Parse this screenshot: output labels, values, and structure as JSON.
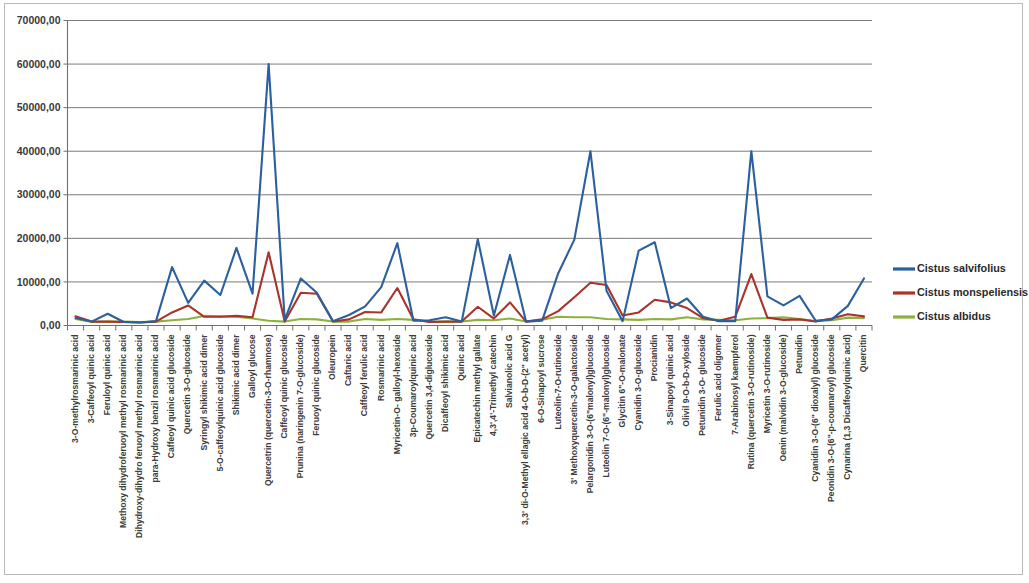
{
  "chart_data": {
    "type": "line",
    "title": "",
    "subtitle": "",
    "xlabel": "",
    "ylabel": "",
    "ylim": [
      0,
      70000
    ],
    "ytick_labels": [
      "0,00",
      "10000,00",
      "20000,00",
      "30000,00",
      "40000,00",
      "50000,00",
      "60000,00",
      "70000,00"
    ],
    "ytick_values": [
      0,
      10000,
      20000,
      30000,
      40000,
      50000,
      60000,
      70000
    ],
    "grid": true,
    "legend_position": "right",
    "categories": [
      "3-O-methylrosmarinic acid",
      "3-Caffeoyl quinic acid",
      "Feruloyl quinic acid",
      "Methoxy dihydroferuoyl methyl rosmarinic acid",
      "Dihydroxy-dihydro feruoyl methyl rosmarinic acid",
      "para-Hydroxy benzil rosmarinic acid",
      "Caffeoyl quinic acid glucoside",
      "Quercetin 3-O-glucoside",
      "Syringyl shikimic acid dimer",
      "5-O-caffeoylquinic acid glucoside",
      "Shikimic acid dimer",
      "Galloyl glucose",
      "Quercetrin (quercetin-3-O-rhamnose)",
      "Caffeoyl quinic glucoside",
      "Prunina (naringenin 7-O-glucoside)",
      "Feruoyl quinic glucoside",
      "Oleuropein",
      "Caftaric acid",
      "Caffeoyl ferulic acid",
      "Rosmarinic acid",
      "Myricetin-O- galloyl-hexoside",
      "3p-Coumaroylquinic acid",
      "Quercetin 3,4-diglucoside",
      "Dicaffeoyl shikimic acid",
      "Quinic acid",
      "Epicatechin methyl gallate",
      "4,3',4'-Trimethyl catechin",
      "Salvianolic acid G",
      "3,3' di-O-Methyl ellagic acid 4-O-b-D-(2\" acetyl)",
      "6-O-Sinapoyl sucrose",
      "Luteolin-7-O-rutinoside",
      "3' Methoxyquercetin-3-O-galactoside",
      "Pelargonidin 3-O-(6\"malonyl)glucoside",
      "Luteolin 7-O-(6\"-malonyl)glucoside",
      "Glycitin 6\"-O-malonate",
      "Cyanidin 3-O-glucoside",
      "Procianidin",
      "3-Sinapoyl quinic acid",
      "Olivil 9-O-b-D-xyloside",
      "Petunidin 3-O- glucoside",
      "Ferulic acid oligomer",
      "7-Arabinosyl kaempferol",
      "Rutina (quercetin 3-O-rutinoside)",
      "Myricetin 3-O-rutinoside",
      "Oenin (malvidin 3-O-glucoside)",
      "Petunidin",
      "Cyanidin 3-O-(6\" dioxalyl) glucoside",
      "Peonidin 3-O-(6\"-p-coumaroyl) glucoside",
      "Cynarina (1,3 Dicaffeoylquinic acid)",
      "Quercitin"
    ],
    "series": [
      {
        "name": "Cistus salvifolius",
        "color": "#2b5f9e",
        "values": [
          1700,
          900,
          2700,
          800,
          700,
          1000,
          13400,
          5200,
          10300,
          7000,
          17800,
          7300,
          60000,
          1300,
          10800,
          7500,
          1000,
          2400,
          4400,
          8800,
          18900,
          1100,
          1200,
          1900,
          900,
          19800,
          2300,
          16200,
          900,
          1100,
          12000,
          19700,
          40000,
          8000,
          1000,
          17200,
          19100,
          4000,
          6200,
          2000,
          1000,
          1000,
          40000,
          6700,
          4600,
          6800,
          1100,
          1400,
          4500,
          10800
        ]
      },
      {
        "name": "Cistus monspeliensis",
        "color": "#a8342a",
        "values": [
          2100,
          900,
          900,
          800,
          700,
          900,
          3000,
          4600,
          2000,
          2000,
          2200,
          1900,
          16800,
          900,
          7500,
          7300,
          900,
          1400,
          3100,
          3000,
          8600,
          1400,
          800,
          900,
          900,
          4300,
          1600,
          5300,
          900,
          1400,
          3300,
          6500,
          9800,
          9300,
          2300,
          3000,
          5900,
          5300,
          4000,
          1700,
          1100,
          2000,
          11800,
          1800,
          1300,
          1400,
          900,
          1600,
          2600,
          2100
        ]
      },
      {
        "name": "Cistus albidus",
        "color": "#8db23c",
        "values": [
          1500,
          800,
          900,
          900,
          800,
          900,
          1200,
          1500,
          2200,
          2100,
          2000,
          1600,
          1100,
          900,
          1500,
          1400,
          900,
          900,
          1500,
          1300,
          1500,
          1300,
          900,
          900,
          900,
          1300,
          1200,
          1600,
          900,
          1300,
          2000,
          1900,
          1900,
          1500,
          1400,
          1300,
          1500,
          1400,
          1900,
          1400,
          1300,
          1200,
          1600,
          1700,
          1900,
          1500,
          1000,
          1200,
          1800,
          1700
        ]
      }
    ]
  },
  "legend": {
    "items": [
      {
        "label": "Cistus salvifolius",
        "color": "#2b5f9e"
      },
      {
        "label": "Cistus monspeliensis",
        "color": "#a8342a"
      },
      {
        "label": "Cistus albidus",
        "color": "#8db23c"
      }
    ]
  }
}
